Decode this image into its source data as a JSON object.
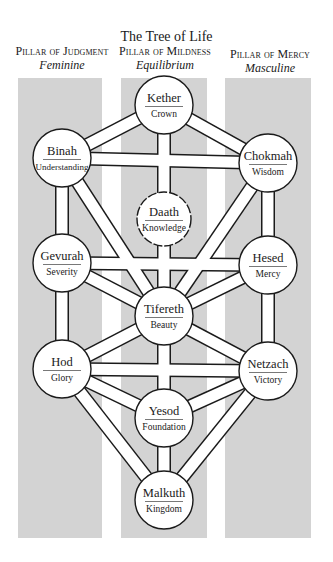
{
  "title": "The Tree of Life",
  "pillars": [
    {
      "name": "Pillar of Judgment",
      "sub": "Feminine",
      "x": 18,
      "w": 84
    },
    {
      "name": "Pillar of Mildness",
      "sub": "Equilibrium",
      "x": 121,
      "w": 86
    },
    {
      "name": "Pillar of Mercy",
      "sub": "Masculine",
      "x": 225,
      "w": 86
    }
  ],
  "pillar_top": 78,
  "pillar_bottom": 538,
  "colors": {
    "pillar": "#d3d3d3",
    "path_fill": "#ffffff",
    "stroke": "#1a1a1a",
    "background": "#ffffff"
  },
  "sephirot": [
    {
      "id": "kether",
      "name": "Kether",
      "meaning": "Crown",
      "cx": 164,
      "cy": 105,
      "r": 29,
      "dashed": false
    },
    {
      "id": "chokmah",
      "name": "Chokmah",
      "meaning": "Wisdom",
      "cx": 268,
      "cy": 163,
      "r": 29,
      "dashed": false
    },
    {
      "id": "binah",
      "name": "Binah",
      "meaning": "Understanding",
      "cx": 62,
      "cy": 158,
      "r": 29,
      "dashed": false
    },
    {
      "id": "daath",
      "name": "Daath",
      "meaning": "Knowledge",
      "cx": 164,
      "cy": 219,
      "r": 27,
      "dashed": true
    },
    {
      "id": "hesed",
      "name": "Hesed",
      "meaning": "Mercy",
      "cx": 268,
      "cy": 265,
      "r": 29,
      "dashed": false
    },
    {
      "id": "gevurah",
      "name": "Gevurah",
      "meaning": "Severity",
      "cx": 62,
      "cy": 263,
      "r": 29,
      "dashed": false
    },
    {
      "id": "tifereth",
      "name": "Tifereth",
      "meaning": "Beauty",
      "cx": 164,
      "cy": 316,
      "r": 29,
      "dashed": false
    },
    {
      "id": "hod",
      "name": "Hod",
      "meaning": "Glory",
      "cx": 62,
      "cy": 369,
      "r": 29,
      "dashed": false
    },
    {
      "id": "netzach",
      "name": "Netzach",
      "meaning": "Victory",
      "cx": 268,
      "cy": 371,
      "r": 29,
      "dashed": false
    },
    {
      "id": "yesod",
      "name": "Yesod",
      "meaning": "Foundation",
      "cx": 164,
      "cy": 418,
      "r": 29,
      "dashed": false
    },
    {
      "id": "malkuth",
      "name": "Malkuth",
      "meaning": "Kingdom",
      "cx": 164,
      "cy": 500,
      "r": 29,
      "dashed": false
    }
  ],
  "paths": [
    [
      "kether",
      "chokmah"
    ],
    [
      "kether",
      "binah"
    ],
    [
      "kether",
      "daath"
    ],
    [
      "chokmah",
      "binah"
    ],
    [
      "chokmah",
      "hesed"
    ],
    [
      "chokmah",
      "tifereth"
    ],
    [
      "binah",
      "gevurah"
    ],
    [
      "binah",
      "tifereth"
    ],
    [
      "hesed",
      "gevurah"
    ],
    [
      "hesed",
      "tifereth"
    ],
    [
      "hesed",
      "netzach"
    ],
    [
      "gevurah",
      "tifereth"
    ],
    [
      "gevurah",
      "hod"
    ],
    [
      "daath",
      "tifereth"
    ],
    [
      "tifereth",
      "netzach"
    ],
    [
      "tifereth",
      "hod"
    ],
    [
      "tifereth",
      "yesod"
    ],
    [
      "netzach",
      "hod"
    ],
    [
      "netzach",
      "yesod"
    ],
    [
      "netzach",
      "malkuth"
    ],
    [
      "hod",
      "yesod"
    ],
    [
      "hod",
      "malkuth"
    ],
    [
      "yesod",
      "malkuth"
    ]
  ],
  "path_width": 12
}
